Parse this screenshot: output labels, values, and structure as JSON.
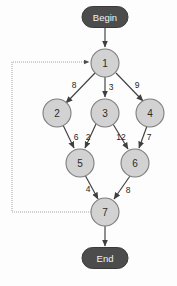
{
  "diagram": {
    "type": "directed-weighted-graph",
    "colors": {
      "node_fill": "#d2d2d2",
      "node_stroke": "#7d7d7d",
      "terminal_fill": "#4c4c4c",
      "terminal_text": "#f2f2f2",
      "edge": "#3f3f3f",
      "loop_edge": "#9a9a9a",
      "background": "#fdfdfd"
    },
    "terminals": {
      "start": {
        "label": "Begin",
        "cx": 105,
        "cy": 17,
        "w": 46,
        "h": 21
      },
      "end": {
        "label": "End",
        "cx": 105,
        "cy": 258,
        "w": 46,
        "h": 21
      }
    },
    "nodes": [
      {
        "id": "n1",
        "label": "1",
        "cx": 105,
        "cy": 63,
        "r": 14
      },
      {
        "id": "n2",
        "label": "2",
        "cx": 57,
        "cy": 113,
        "r": 14
      },
      {
        "id": "n3",
        "label": "3",
        "cx": 105,
        "cy": 113,
        "r": 14
      },
      {
        "id": "n4",
        "label": "4",
        "cx": 150,
        "cy": 113,
        "r": 14
      },
      {
        "id": "n5",
        "label": "5",
        "cx": 80,
        "cy": 163,
        "r": 14
      },
      {
        "id": "n6",
        "label": "6",
        "cx": 135,
        "cy": 163,
        "r": 14
      },
      {
        "id": "n7",
        "label": "7",
        "cx": 105,
        "cy": 212,
        "r": 14
      }
    ],
    "edges": [
      {
        "id": "e-begin-1",
        "from": "Begin",
        "to": "1",
        "weight": "",
        "x1": 105,
        "y1": 28,
        "x2": 105,
        "y2": 47
      },
      {
        "id": "e-1-2",
        "from": "1",
        "to": "2",
        "weight": "8",
        "x1": 95,
        "y1": 73,
        "x2": 66,
        "y2": 103,
        "lx": 74,
        "ly": 85
      },
      {
        "id": "e-1-3",
        "from": "1",
        "to": "3",
        "weight": "3",
        "x1": 105,
        "y1": 77,
        "x2": 105,
        "y2": 97,
        "lx": 111,
        "ly": 87
      },
      {
        "id": "e-1-4",
        "from": "1",
        "to": "4",
        "weight": "9",
        "x1": 116,
        "y1": 73,
        "x2": 143,
        "y2": 101,
        "lx": 137,
        "ly": 85
      },
      {
        "id": "e-2-5",
        "from": "2",
        "to": "5",
        "weight": "6",
        "x1": 63,
        "y1": 125,
        "x2": 74,
        "y2": 148,
        "lx": 76,
        "ly": 137
      },
      {
        "id": "e-3-5",
        "from": "3",
        "to": "5",
        "weight": "2",
        "x1": 96,
        "y1": 124,
        "x2": 85,
        "y2": 148,
        "lx": 88,
        "ly": 137
      },
      {
        "id": "e-3-6",
        "from": "3",
        "to": "6",
        "weight": "12",
        "x1": 113,
        "y1": 124,
        "x2": 128,
        "y2": 149,
        "lx": 121,
        "ly": 137
      },
      {
        "id": "e-4-6",
        "from": "4",
        "to": "6",
        "weight": "7",
        "x1": 147,
        "y1": 126,
        "x2": 139,
        "y2": 148,
        "lx": 149,
        "ly": 137
      },
      {
        "id": "e-5-7",
        "from": "5",
        "to": "7",
        "weight": "4",
        "x1": 85,
        "y1": 175,
        "x2": 98,
        "y2": 199,
        "lx": 88,
        "ly": 189
      },
      {
        "id": "e-6-7",
        "from": "6",
        "to": "7",
        "weight": "8",
        "x1": 130,
        "y1": 176,
        "x2": 114,
        "y2": 199,
        "lx": 128,
        "ly": 190
      },
      {
        "id": "e-7-end",
        "from": "7",
        "to": "End",
        "weight": "",
        "x1": 105,
        "y1": 226,
        "x2": 105,
        "y2": 246
      }
    ],
    "feedback_edge": {
      "id": "e-7-1-loop",
      "from": "7",
      "to": "1",
      "weight": "",
      "path": "M 91 212 L 12 212 L 12 62 L 89 62"
    }
  }
}
